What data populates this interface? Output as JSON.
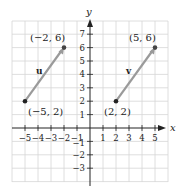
{
  "diagram": {
    "title": "",
    "axes": {
      "x_label": "x",
      "y_label": "y",
      "x_ticks": [
        {
          "value": -5,
          "label": "−5"
        },
        {
          "value": -4,
          "label": "−4"
        },
        {
          "value": -3,
          "label": "−3"
        },
        {
          "value": -2,
          "label": "−2"
        },
        {
          "value": -1,
          "label": "−1"
        },
        {
          "value": 1,
          "label": "1"
        },
        {
          "value": 2,
          "label": "2"
        },
        {
          "value": 3,
          "label": "3"
        },
        {
          "value": 4,
          "label": "4"
        },
        {
          "value": 5,
          "label": "5"
        }
      ],
      "y_ticks": [
        {
          "value": 7,
          "label": "7"
        },
        {
          "value": 6,
          "label": "6"
        },
        {
          "value": 5,
          "label": "5"
        },
        {
          "value": 4,
          "label": "4"
        },
        {
          "value": 3,
          "label": "3"
        },
        {
          "value": 2,
          "label": "2"
        },
        {
          "value": 1,
          "label": "1"
        },
        {
          "value": -1,
          "label": "−1"
        },
        {
          "value": -2,
          "label": "−2"
        },
        {
          "value": -3,
          "label": "−3"
        }
      ],
      "grid": {
        "x_range": [
          -6,
          6
        ],
        "y_range": [
          -4,
          8
        ]
      }
    },
    "vectors": [
      {
        "name": "u",
        "tail": {
          "x": -5,
          "y": 2,
          "label": "(−5, 2)"
        },
        "head": {
          "x": -2,
          "y": 6,
          "label": "(−2, 6)"
        }
      },
      {
        "name": "v",
        "tail": {
          "x": 2,
          "y": 2,
          "label": "(2, 2)"
        },
        "head": {
          "x": 5,
          "y": 6,
          "label": "(5, 6)"
        }
      }
    ],
    "colors": {
      "grid": "#d6d6d6",
      "axis": "#222222",
      "vector": "#9a9a9a",
      "point": "#222222"
    }
  }
}
